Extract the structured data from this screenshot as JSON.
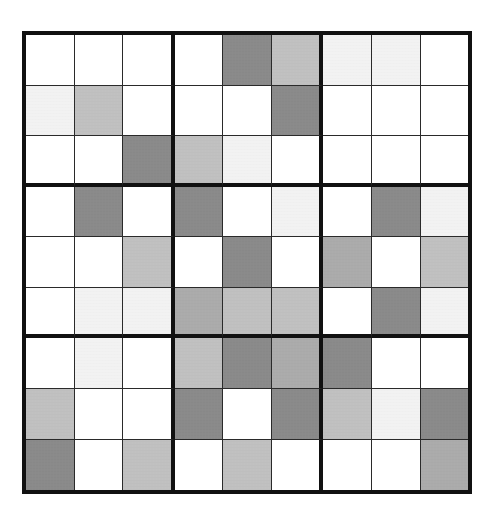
{
  "figure": {
    "kind": "sudoku-style-9x9-shaded-grid",
    "rows": 9,
    "cols": 9,
    "block_rows": 3,
    "block_cols": 3
  },
  "palette": {
    "white": "#ffffff",
    "vlight": "#f2f2f2",
    "light": "#c0c0c0",
    "medium": "#ababab",
    "dark": "#8a8a8a",
    "border_thick": "#111111",
    "border_thin": "#2a2a2a",
    "page_background": "#ffffff"
  },
  "chart_data": {
    "type": "heatmap",
    "title": "",
    "xlabel": "",
    "ylabel": "",
    "grid": true,
    "legend": "none",
    "shade_levels": [
      "white",
      "vlight",
      "light",
      "medium",
      "dark"
    ],
    "shade_values": {
      "white": 0,
      "vlight": 1,
      "light": 2,
      "medium": 3,
      "dark": 4
    },
    "cells": [
      [
        "white",
        "white",
        "white",
        "white",
        "dark",
        "light",
        "vlight",
        "vlight",
        "white"
      ],
      [
        "vlight",
        "light",
        "white",
        "white",
        "white",
        "dark",
        "white",
        "white",
        "white"
      ],
      [
        "white",
        "white",
        "dark",
        "light",
        "vlight",
        "white",
        "white",
        "white",
        "white"
      ],
      [
        "white",
        "dark",
        "white",
        "dark",
        "white",
        "vlight",
        "white",
        "dark",
        "vlight"
      ],
      [
        "white",
        "white",
        "light",
        "white",
        "dark",
        "white",
        "medium",
        "white",
        "light"
      ],
      [
        "white",
        "vlight",
        "vlight",
        "medium",
        "light",
        "light",
        "white",
        "dark",
        "vlight"
      ],
      [
        "white",
        "vlight",
        "white",
        "light",
        "dark",
        "medium",
        "dark",
        "white",
        "white"
      ],
      [
        "light",
        "white",
        "white",
        "dark",
        "white",
        "dark",
        "light",
        "vlight",
        "dark"
      ],
      [
        "dark",
        "white",
        "light",
        "white",
        "light",
        "white",
        "white",
        "white",
        "medium"
      ]
    ]
  }
}
